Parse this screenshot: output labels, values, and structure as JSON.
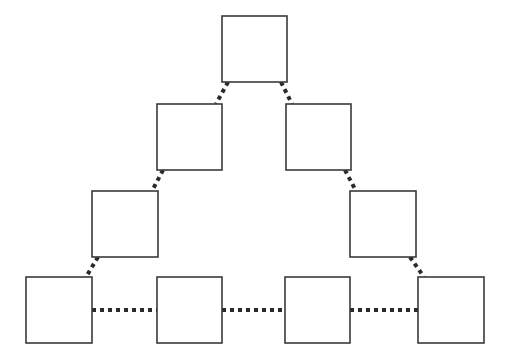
{
  "diagram": {
    "type": "triangle-of-boxes",
    "width": 505,
    "height": 362,
    "colors": {
      "background": "#ffffff",
      "box_stroke": "#3a3a3a",
      "box_fill": "#ffffff",
      "edge_stroke": "#2a2a2a"
    },
    "nodes": [
      {
        "id": "top",
        "label": "",
        "x": 222,
        "y": 16,
        "w": 65,
        "h": 66
      },
      {
        "id": "row2-left",
        "label": "",
        "x": 157,
        "y": 104,
        "w": 65,
        "h": 66
      },
      {
        "id": "row2-right",
        "label": "",
        "x": 286,
        "y": 104,
        "w": 65,
        "h": 66
      },
      {
        "id": "row3-left",
        "label": "",
        "x": 92,
        "y": 191,
        "w": 66,
        "h": 66
      },
      {
        "id": "row3-right",
        "label": "",
        "x": 350,
        "y": 191,
        "w": 66,
        "h": 66
      },
      {
        "id": "bottom-1",
        "label": "",
        "x": 26,
        "y": 277,
        "w": 66,
        "h": 66
      },
      {
        "id": "bottom-2",
        "label": "",
        "x": 157,
        "y": 277,
        "w": 65,
        "h": 66
      },
      {
        "id": "bottom-3",
        "label": "",
        "x": 285,
        "y": 277,
        "w": 65,
        "h": 66
      },
      {
        "id": "bottom-4",
        "label": "",
        "x": 418,
        "y": 277,
        "w": 66,
        "h": 66
      }
    ],
    "edges": [
      {
        "from": "top",
        "to": "row2-left",
        "style": "dashed",
        "x1": 228,
        "y1": 82,
        "x2": 216,
        "y2": 104
      },
      {
        "from": "top",
        "to": "row2-right",
        "style": "dashed",
        "x1": 281,
        "y1": 82,
        "x2": 292,
        "y2": 104
      },
      {
        "from": "row2-left",
        "to": "row3-left",
        "style": "dashed",
        "x1": 163,
        "y1": 170,
        "x2": 152,
        "y2": 191
      },
      {
        "from": "row2-right",
        "to": "row3-right",
        "style": "dashed",
        "x1": 345,
        "y1": 170,
        "x2": 356,
        "y2": 191
      },
      {
        "from": "row3-left",
        "to": "bottom-1",
        "style": "dashed",
        "x1": 98,
        "y1": 257,
        "x2": 86,
        "y2": 277
      },
      {
        "from": "row3-right",
        "to": "bottom-4",
        "style": "dashed",
        "x1": 410,
        "y1": 257,
        "x2": 424,
        "y2": 277
      },
      {
        "from": "bottom-1",
        "to": "bottom-2",
        "style": "dashed",
        "x1": 92,
        "y1": 310,
        "x2": 157,
        "y2": 310
      },
      {
        "from": "bottom-2",
        "to": "bottom-3",
        "style": "dashed",
        "x1": 222,
        "y1": 310,
        "x2": 285,
        "y2": 310
      },
      {
        "from": "bottom-3",
        "to": "bottom-4",
        "style": "dashed",
        "x1": 350,
        "y1": 310,
        "x2": 418,
        "y2": 310
      }
    ]
  }
}
